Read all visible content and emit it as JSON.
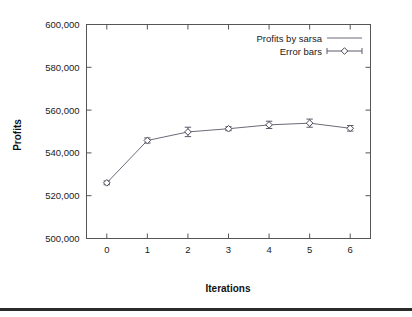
{
  "chart_data": {
    "type": "line",
    "title": "",
    "xlabel": "Iterations",
    "ylabel": "Profits",
    "x": [
      0,
      1,
      2,
      3,
      4,
      5,
      6
    ],
    "xtick_labels": [
      "0",
      "1",
      "2",
      "3",
      "4",
      "5",
      "6"
    ],
    "xlim": [
      -0.5,
      6.5
    ],
    "ylim": [
      500000,
      600000
    ],
    "ytick_labels": [
      "500,000",
      "520,000",
      "540,000",
      "560,000",
      "580,000",
      "600,000"
    ],
    "ytick_values": [
      500000,
      520000,
      540000,
      560000,
      580000,
      600000
    ],
    "grid": false,
    "legend_position": "top-right",
    "series": [
      {
        "name": "Profits by sarsa",
        "style": "line",
        "values": [
          526000,
          545800,
          549800,
          551300,
          553100,
          553900,
          551500
        ]
      },
      {
        "name": "Error bars",
        "style": "errorbar-diamond",
        "values": [
          526000,
          545800,
          549800,
          551300,
          553100,
          553900,
          551500
        ],
        "errors": [
          900,
          1200,
          2200,
          900,
          1700,
          1900,
          1300
        ]
      }
    ],
    "legend": [
      {
        "label": "Profits by sarsa",
        "symbol": "line"
      },
      {
        "label": "Error bars",
        "symbol": "errorbar-diamond"
      }
    ],
    "colors": {
      "line": "#6b6b7a",
      "marker_stroke": "#4a4a58",
      "marker_fill": "#ffffff",
      "axis": "#555555",
      "text": "#1a1a1a",
      "background": "#ffffff",
      "rule": "#2b2b2b"
    }
  }
}
